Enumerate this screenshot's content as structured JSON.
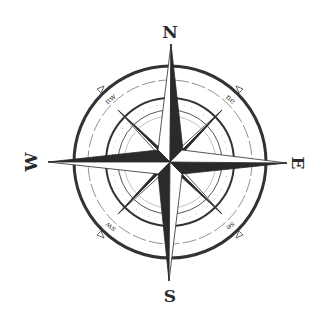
{
  "compass": {
    "colors": {
      "ink": "#2a2a2a",
      "light": "#ffffff",
      "ring": "#333333",
      "thin": "#666666"
    },
    "center": {
      "x": 170,
      "y": 162
    },
    "cardinals": {
      "n": "N",
      "e": "E",
      "s": "S",
      "w": "W"
    },
    "intercardinals": {
      "nw": "nw",
      "ne": "ne",
      "sw": "sw",
      "se": "se"
    }
  }
}
